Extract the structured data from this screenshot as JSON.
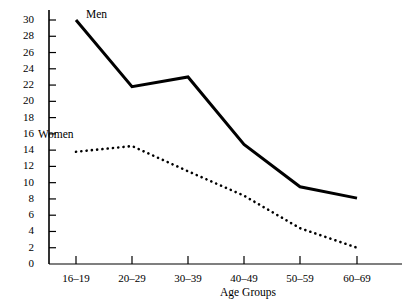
{
  "chart_data": {
    "type": "line",
    "title": "",
    "xlabel": "Age Groups",
    "ylabel": "",
    "categories": [
      "16–19",
      "20–29",
      "30–39",
      "40–49",
      "50–59",
      "60–69"
    ],
    "ylim": [
      0,
      30
    ],
    "ytick_values": [
      0,
      2,
      4,
      6,
      8,
      10,
      12,
      14,
      16,
      18,
      20,
      22,
      24,
      26,
      28,
      30
    ],
    "ytick_labels": [
      "0",
      "2",
      "4",
      "6",
      "8",
      "10",
      "12",
      "14",
      "16",
      "18",
      "20",
      "22",
      "24",
      "26",
      "28",
      "30"
    ],
    "grid": false,
    "legend_position": "inline-annotation",
    "series": [
      {
        "name": "Men",
        "style": "solid",
        "color": "#000000",
        "line_width": 3,
        "values": [
          30,
          21.8,
          23,
          14.7,
          9.5,
          8.1
        ],
        "label_x_category": "20–29",
        "label_text": "Men"
      },
      {
        "name": "Women",
        "style": "dotted",
        "color": "#000000",
        "line_width": 2.6,
        "values": [
          13.8,
          14.5,
          11.4,
          8.4,
          4.4,
          2.0
        ],
        "label_text": "Women"
      }
    ]
  },
  "annotations": {
    "men_label": "Men",
    "women_label": "Women",
    "xaxis_title": "Age Groups"
  },
  "colors": {
    "axis": "#000000",
    "men_series": "#000000",
    "women_series": "#000000",
    "background": "#ffffff"
  }
}
